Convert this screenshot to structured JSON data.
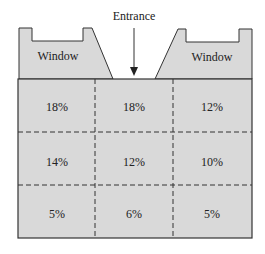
{
  "diagram": {
    "entrance_label": "Entrance",
    "windows": [
      {
        "label": "Window",
        "position": "left"
      },
      {
        "label": "Window",
        "position": "right"
      }
    ],
    "grid": {
      "rows": 3,
      "cols": 3,
      "cells": [
        [
          "18%",
          "18%",
          "12%"
        ],
        [
          "14%",
          "12%",
          "10%"
        ],
        [
          "5%",
          "6%",
          "5%"
        ]
      ]
    },
    "colors": {
      "fill": "#d9d9d9",
      "stroke": "#333333",
      "text": "#222222"
    }
  }
}
